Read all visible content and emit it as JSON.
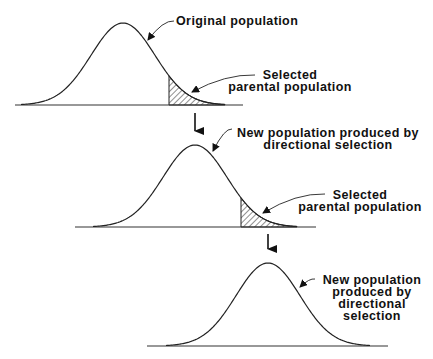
{
  "figure": {
    "panels": [
      {
        "id": "original",
        "curve": {
          "mean_x": 123,
          "sd": 32,
          "peak_y": 23,
          "baseline_y": 105,
          "x_start": 15,
          "x_end": 243
        },
        "shaded_from_x": 169,
        "labels": [
          {
            "id": "original-label",
            "lines": [
              "Original population"
            ],
            "x": 176,
            "y": 25,
            "anchor": "start",
            "leader": {
              "from": [
                174,
                21
              ],
              "to": [
                148,
                40
              ]
            }
          },
          {
            "id": "selected-label-1",
            "lines": [
              "Selected",
              "parental population"
            ],
            "x": 290,
            "y": 79,
            "anchor": "middle",
            "leader": {
              "from": [
                255,
                75
              ],
              "to": [
                192,
                92
              ]
            }
          }
        ]
      },
      {
        "id": "generation-2",
        "curve": {
          "mean_x": 195,
          "sd": 32,
          "peak_y": 145,
          "baseline_y": 227,
          "x_start": 75,
          "x_end": 316
        },
        "shaded_from_x": 241,
        "labels": [
          {
            "id": "new-population-label-1",
            "lines": [
              "New population produced by",
              "directional selection"
            ],
            "x": 328,
            "y": 137,
            "anchor": "middle",
            "leader": {
              "from": [
                232,
                129
              ],
              "to": [
                213,
                151
              ]
            }
          },
          {
            "id": "selected-label-2",
            "lines": [
              "Selected",
              "parental population"
            ],
            "x": 360,
            "y": 199,
            "anchor": "middle",
            "leader": {
              "from": [
                325,
                194
              ],
              "to": [
                263,
                213
              ]
            }
          }
        ]
      },
      {
        "id": "generation-3",
        "curve": {
          "mean_x": 268,
          "sd": 32,
          "peak_y": 263,
          "baseline_y": 346,
          "x_start": 147,
          "x_end": 388
        },
        "shaded_from_x": null,
        "labels": [
          {
            "id": "new-population-label-2",
            "lines": [
              "New population",
              "produced by",
              "directional",
              "selection"
            ],
            "x": 372,
            "y": 284,
            "anchor": "middle",
            "leader": {
              "from": [
                315,
                279
              ],
              "to": [
                300,
                287
              ]
            }
          }
        ]
      }
    ],
    "arrows": [
      {
        "id": "arrow-1",
        "x": 195,
        "y1": 113,
        "y2": 139
      },
      {
        "id": "arrow-2",
        "x": 268,
        "y1": 234,
        "y2": 257
      }
    ],
    "colors": {
      "ink": "#222222",
      "background": "#ffffff"
    }
  }
}
